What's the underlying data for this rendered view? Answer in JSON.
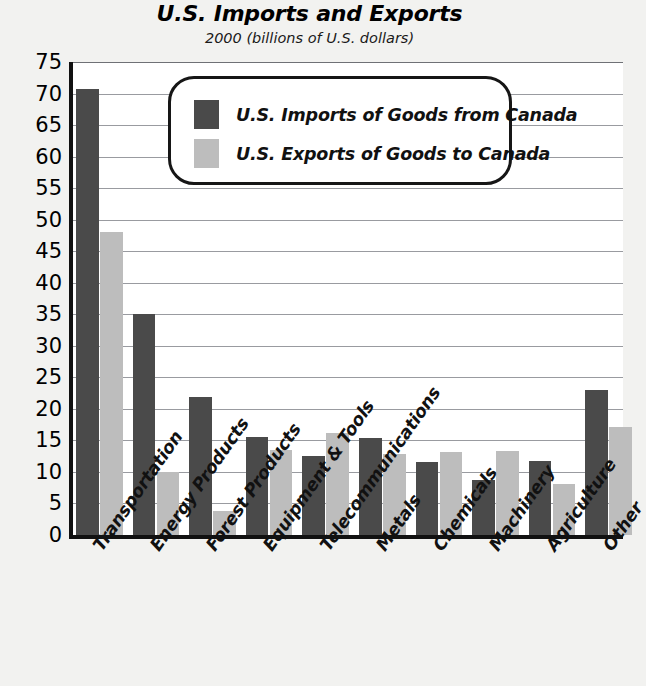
{
  "chart_data": {
    "type": "bar",
    "title": "U.S. Imports and Exports",
    "subtitle": "2000 (billions of U.S. dollars)",
    "xlabel": "",
    "ylabel": "",
    "ylim": [
      0,
      75
    ],
    "ytick_step": 5,
    "yticks": [
      75,
      70,
      65,
      60,
      55,
      50,
      45,
      40,
      35,
      30,
      25,
      20,
      15,
      10,
      5,
      0
    ],
    "grid": true,
    "legend_position": "inside-top-center",
    "categories": [
      "Transportation",
      "Energy Products",
      "Forest Products",
      "Equipment & Tools",
      "Telecommunications",
      "Metals",
      "Chemicals",
      "Machinery",
      "Agriculture",
      "Other"
    ],
    "series": [
      {
        "name": "U.S. Imports of Goods from Canada",
        "color": "#4a4a4a",
        "values": [
          70.8,
          35.0,
          21.9,
          15.6,
          12.6,
          15.4,
          11.6,
          8.7,
          11.8,
          23.0
        ]
      },
      {
        "name": "U.S. Exports of Goods to Canada",
        "color": "#bdbdbd",
        "values": [
          48.0,
          10.0,
          3.8,
          13.5,
          16.2,
          12.8,
          13.1,
          13.3,
          8.1,
          17.2
        ]
      }
    ]
  },
  "colors": {
    "imports": "#4a4a4a",
    "exports": "#bdbdbd",
    "background": "#f2f2f0",
    "plot_background": "#ffffff",
    "axis": "#111111",
    "gridline": "#999ba0"
  }
}
